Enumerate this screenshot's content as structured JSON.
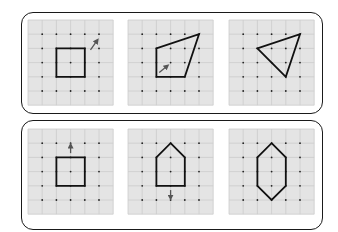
{
  "colors": {
    "grid_fill": "#e4e4e4",
    "grid_line": "#cccccc",
    "dot": "#222222",
    "shape": "#111111",
    "arrow": "#555555",
    "frame": "#1a1a1a"
  },
  "grid": {
    "cells": 6,
    "cell_px": 14.2
  },
  "frames": [
    {
      "name": "top-panel",
      "x": 21,
      "y": 12,
      "w": 302,
      "h": 102
    },
    {
      "name": "bottom-panel",
      "x": 21,
      "y": 120,
      "w": 302,
      "h": 110
    }
  ],
  "panels": [
    {
      "name": "top-grid-1-square",
      "origin": [
        28,
        20
      ],
      "shape": [
        [
          2,
          2
        ],
        [
          4,
          2
        ],
        [
          4,
          4
        ],
        [
          2,
          4
        ]
      ],
      "arrow": {
        "from": [
          4.4,
          2.1
        ],
        "to": [
          4.9,
          1.4
        ],
        "direction": "up-right"
      }
    },
    {
      "name": "top-grid-2-quadrilateral",
      "origin": [
        128,
        20
      ],
      "shape": [
        [
          2,
          2
        ],
        [
          5,
          1
        ],
        [
          4,
          4
        ],
        [
          2,
          4
        ]
      ],
      "arrow": {
        "from": [
          2.2,
          3.7
        ],
        "to": [
          2.8,
          3.2
        ],
        "direction": "up-right"
      }
    },
    {
      "name": "top-grid-3-triangle",
      "origin": [
        229,
        20
      ],
      "shape": [
        [
          2,
          2
        ],
        [
          5,
          1
        ],
        [
          4,
          4
        ]
      ],
      "arrow": null
    },
    {
      "name": "bottom-grid-1-square",
      "origin": [
        28,
        129
      ],
      "shape": [
        [
          2,
          2
        ],
        [
          4,
          2
        ],
        [
          4,
          4
        ],
        [
          2,
          4
        ]
      ],
      "arrow": {
        "from": [
          3,
          1.7
        ],
        "to": [
          3,
          1.1
        ],
        "direction": "up"
      }
    },
    {
      "name": "bottom-grid-2-pentagon",
      "origin": [
        128,
        129
      ],
      "shape": [
        [
          3,
          1
        ],
        [
          4,
          2
        ],
        [
          4,
          4
        ],
        [
          2,
          4
        ],
        [
          2,
          2
        ]
      ],
      "arrow": {
        "from": [
          3,
          4.3
        ],
        "to": [
          3,
          4.9
        ],
        "direction": "down"
      }
    },
    {
      "name": "bottom-grid-3-hexagon",
      "origin": [
        229,
        129
      ],
      "shape": [
        [
          3,
          1
        ],
        [
          4,
          2
        ],
        [
          4,
          4
        ],
        [
          3,
          5
        ],
        [
          2,
          4
        ],
        [
          2,
          2
        ]
      ],
      "arrow": null
    }
  ]
}
